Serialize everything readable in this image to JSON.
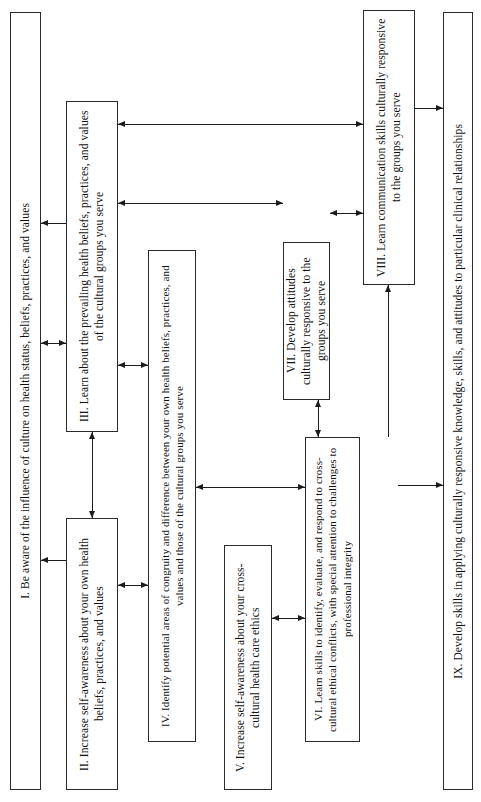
{
  "diagram": {
    "type": "flowchart",
    "orientation": "rotated-90 (text reads bottom-to-top)",
    "background_color": "#ffffff",
    "line_color": "#1c1c1c",
    "box_border_color": "#2b2b2b",
    "nodes": [
      {
        "id": "I",
        "label": "I. Be aware of the influence of culture on health status, beliefs, practices, and values"
      },
      {
        "id": "II",
        "label": "II. Increase self-awareness about your own health beliefs, practices, and values"
      },
      {
        "id": "III",
        "label": "III. Learn about the prevailing health beliefs, practices, and values of the cultural groups you serve"
      },
      {
        "id": "IV",
        "label": "IV. Identify potential areas of congruity and difference between your own health beliefs, practices, and values and those of the cultural groups you serve"
      },
      {
        "id": "V",
        "label": "V. Increase self-awareness about your cross-cultural health care ethics"
      },
      {
        "id": "VI",
        "label": "VI. Learn skills to identify, evaluate, and respond to cross-cultural ethical conflicts, with special attention to challenges to professional integrity"
      },
      {
        "id": "VII",
        "label": "VII. Develop attitudes culturally responsive to the groups you serve"
      },
      {
        "id": "VIII",
        "label": "VIII. Learn communication skills culturally responsive to the groups you serve"
      },
      {
        "id": "IX",
        "label": "IX. Develop skills in applying culturally responsive knowledge, skills, and attitudes to particular clinical relationships"
      }
    ],
    "edges": [
      {
        "from": "III",
        "to": "VIII",
        "arrow": "double"
      },
      {
        "from": "III",
        "to": "VII",
        "arrow": "double"
      },
      {
        "from": "VII",
        "to": "VIII",
        "arrow": "double"
      },
      {
        "from": "I",
        "to": "III",
        "arrow": "double"
      },
      {
        "from": "III",
        "to": "IV",
        "arrow": "double"
      },
      {
        "from": "II",
        "to": "III",
        "arrow": "double"
      },
      {
        "from": "VII",
        "to": "VI",
        "arrow": "double"
      },
      {
        "from": "IV",
        "to": "VI",
        "arrow": "double"
      },
      {
        "from": "II",
        "to": "IV",
        "arrow": "double"
      },
      {
        "from": "V",
        "to": "VI",
        "arrow": "double"
      },
      {
        "from": "VI",
        "to": "VIII",
        "arrow": "double"
      },
      {
        "from": "VIII",
        "to": "IX",
        "arrow": "double"
      },
      {
        "from": "VI",
        "to": "IX",
        "arrow": "single"
      },
      {
        "from": "I",
        "to": "II",
        "arrow": "single"
      }
    ]
  }
}
